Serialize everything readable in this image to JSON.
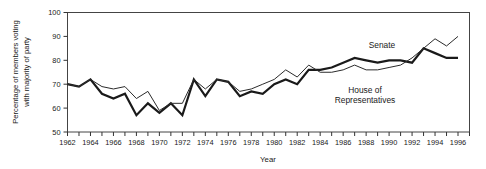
{
  "chart_data": {
    "type": "line",
    "title": "",
    "xlabel": "Year",
    "ylabel": "Percentage of members voting with majority of party",
    "ylabel_line1": "Percentage of members voting",
    "ylabel_line2": "with majority of party",
    "xlim": [
      1962,
      1997
    ],
    "ylim": [
      50,
      100
    ],
    "yticks": [
      50,
      60,
      70,
      80,
      90,
      100
    ],
    "ytick_labels": [
      "50",
      "60",
      "70",
      "80",
      "90",
      "100"
    ],
    "xticks": [
      1962,
      1963,
      1964,
      1965,
      1966,
      1967,
      1968,
      1969,
      1970,
      1971,
      1972,
      1973,
      1974,
      1975,
      1976,
      1977,
      1978,
      1979,
      1980,
      1981,
      1982,
      1983,
      1984,
      1985,
      1986,
      1987,
      1988,
      1989,
      1990,
      1991,
      1992,
      1993,
      1994,
      1995,
      1996,
      1997
    ],
    "xtick_labels_shown": [
      "1962",
      "1964",
      "1966",
      "1968",
      "1970",
      "1972",
      "1974",
      "1976",
      "1978",
      "1980",
      "1982",
      "1984",
      "1986",
      "1988",
      "1990",
      "1992",
      "1994",
      "1996"
    ],
    "grid": false,
    "legend_position": "inline-annotation",
    "x": [
      1962,
      1963,
      1964,
      1965,
      1966,
      1967,
      1968,
      1969,
      1970,
      1971,
      1972,
      1973,
      1974,
      1975,
      1976,
      1977,
      1978,
      1979,
      1980,
      1981,
      1982,
      1983,
      1984,
      1985,
      1986,
      1987,
      1988,
      1989,
      1990,
      1991,
      1992,
      1993,
      1994,
      1995,
      1996
    ],
    "series": [
      {
        "name": "Senate",
        "label_line1": "Senate",
        "color": "#1a1a1a",
        "linewidth": 2.2,
        "values": [
          70,
          69,
          72,
          66,
          64,
          66,
          57,
          62,
          58,
          62,
          57,
          72,
          65,
          72,
          71,
          65,
          67,
          66,
          70,
          72,
          70,
          76,
          76,
          77,
          79,
          81,
          80,
          79,
          80,
          80,
          79,
          85,
          83,
          81,
          81
        ]
      },
      {
        "name": "House of Representatives",
        "label_line1": "House of",
        "label_line2": "Representatives",
        "color": "#2b2b2b",
        "linewidth": 1.0,
        "values": [
          70,
          69,
          72,
          69,
          68,
          69,
          64,
          67,
          59,
          62,
          62,
          72,
          68,
          72,
          71,
          67,
          68,
          70,
          72,
          76,
          73,
          78,
          75,
          75,
          76,
          78,
          76,
          76,
          77,
          78,
          81,
          85,
          89,
          86,
          90
        ]
      }
    ],
    "notes": {
      "senate_label_x": 1986,
      "house_label_x": 1988
    }
  }
}
